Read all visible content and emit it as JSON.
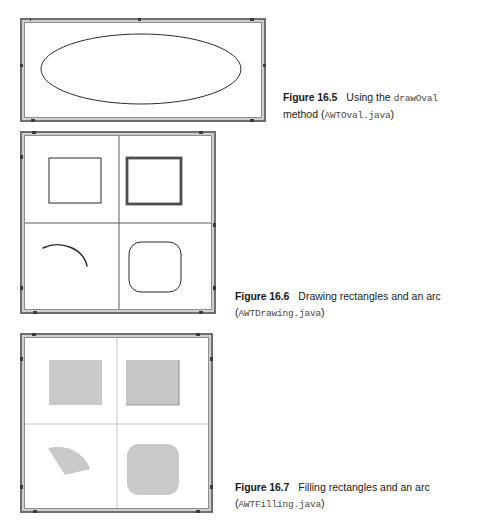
{
  "page": {
    "background_color": "#ffffff",
    "width": 489,
    "height": 528
  },
  "palette": {
    "frame_border": "#6f6f6f",
    "frame_face": "#cfcfcf",
    "canvas_background": "#ffffff",
    "stroke": "#2b2b2b",
    "fill_gray": "#c9c9c9",
    "fill_gray_dark": "#bdbdbd",
    "caption_text": "#1a1a1a",
    "code_text": "#4a4a4a"
  },
  "figures": [
    {
      "id": "figure-16-5",
      "window": {
        "title_label": "",
        "shape_name": "oval",
        "shapes": [
          {
            "name": "oval-outline",
            "type": "ellipse",
            "cx": 119,
            "cy": 45,
            "rx": 99,
            "ry": 35
          }
        ]
      },
      "caption": {
        "label": "Figure 16.5",
        "text_before": "Using the ",
        "code_inline": "drawOval",
        "line2_before": "method (",
        "line2_code": "AWTOval.java",
        "line2_after": ")"
      }
    },
    {
      "id": "figure-16-6",
      "window": {
        "title_label": "",
        "shape_name": "drawing",
        "quadrant_labels": [
          "draw-rect-plain",
          "draw-3d-rect",
          "draw-arc",
          "draw-round-rect"
        ]
      },
      "caption": {
        "label": "Figure 16.6",
        "text_before": "Drawing rectangles and an arc",
        "code_inline": "",
        "line2_before": "(",
        "line2_code": "AWTDrawing.java",
        "line2_after": ")"
      }
    },
    {
      "id": "figure-16-7",
      "window": {
        "title_label": "",
        "shape_name": "filling",
        "quadrant_labels": [
          "fill-rect-plain",
          "fill-3d-rect",
          "fill-arc",
          "fill-round-rect"
        ]
      },
      "caption": {
        "label": "Figure 16.7",
        "text_before": "Filling rectangles and an arc",
        "code_inline": "",
        "line2_before": "(",
        "line2_code": "AWTFilling.java",
        "line2_after": ")"
      }
    }
  ]
}
